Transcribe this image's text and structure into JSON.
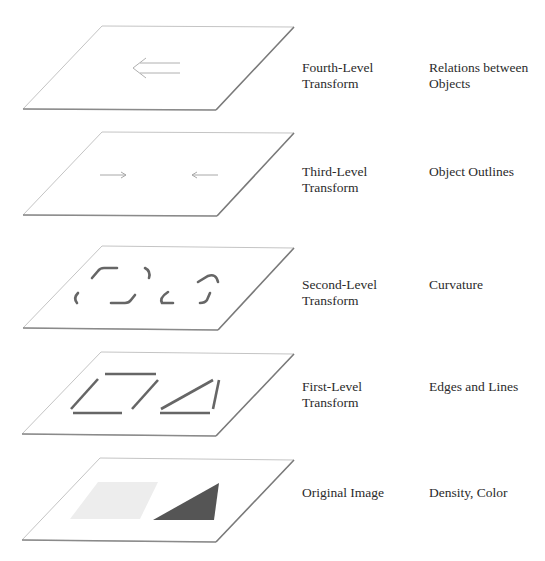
{
  "layers": [
    {
      "id": "fourth",
      "level_label_line1": "Fourth-Level",
      "level_label_line2": "Transform",
      "feature_label_line1": "Relations between",
      "feature_label_line2": "Objects",
      "content": "double-left-arrow"
    },
    {
      "id": "third",
      "level_label_line1": "Third-Level",
      "level_label_line2": "Transform",
      "feature_label_line1": "Object Outlines",
      "feature_label_line2": "",
      "content": "converging-arrows"
    },
    {
      "id": "second",
      "level_label_line1": "Second-Level",
      "level_label_line2": "Transform",
      "feature_label_line1": "Curvature",
      "feature_label_line2": "",
      "content": "curved-corner-fragments"
    },
    {
      "id": "first",
      "level_label_line1": "First-Level",
      "level_label_line2": "Transform",
      "feature_label_line1": "Edges and Lines",
      "feature_label_line2": "",
      "content": "straight-edge-segments"
    },
    {
      "id": "original",
      "level_label_line1": "Original Image",
      "level_label_line2": "",
      "feature_label_line1": "Density, Color",
      "feature_label_line2": "",
      "content": "light-parallelogram-and-dark-triangle"
    }
  ],
  "colors": {
    "plane_fill": "#ffffff",
    "plane_edge_light": "#bdbdbd",
    "plane_edge_dark": "#7a7a7a",
    "arrow": "#a8a8a8",
    "stroke": "#6e6e6e",
    "triangle": "#555555",
    "density_patch": "#ececec"
  }
}
